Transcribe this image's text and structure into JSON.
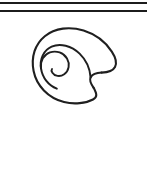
{
  "figure": {
    "kind": "line-drawing",
    "subject_label": "spiral-shell",
    "background_color": "#ffffff",
    "ink_color": "#1f1f1f",
    "canvas": {
      "width": 147,
      "height": 184
    },
    "rules": [
      {
        "name": "top-rule",
        "y": 2,
        "thickness": 2,
        "x_start": 0,
        "x_end": 147,
        "color": "#1c1c1c"
      },
      {
        "name": "second-rule",
        "y": 10,
        "thickness": 2,
        "x_start": 0,
        "x_end": 147,
        "color": "#1c1c1c"
      }
    ],
    "shell": {
      "bounds": {
        "left": 33,
        "top": 30,
        "right": 116,
        "bottom": 104
      },
      "outer_stroke_width": 2.1,
      "inner_stroke_width": 1.9,
      "spiral_center": {
        "x": 68,
        "y": 64
      },
      "aperture_label": "right-point",
      "turns": 2
    },
    "blank_lower_region": {
      "top": 110,
      "height": 74
    }
  }
}
